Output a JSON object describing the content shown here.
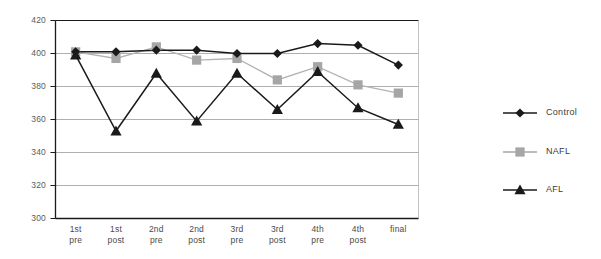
{
  "chart_data": {
    "type": "line",
    "title": "",
    "subtitle": "",
    "xlabel": "",
    "ylabel": "",
    "categories": [
      "1st pre",
      "1st post",
      "2nd pre",
      "2nd post",
      "3rd pre",
      "3rd post",
      "4th pre",
      "4th post",
      "final"
    ],
    "category_lines": [
      [
        "1st",
        "pre"
      ],
      [
        "1st",
        "post"
      ],
      [
        "2nd",
        "pre"
      ],
      [
        "2nd",
        "post"
      ],
      [
        "3rd",
        "pre"
      ],
      [
        "3rd",
        "post"
      ],
      [
        "4th",
        "pre"
      ],
      [
        "4th",
        "post"
      ],
      [
        "final",
        ""
      ]
    ],
    "series": [
      {
        "name": "Control",
        "marker": "diamond",
        "color": "#1a1a1a",
        "line_color": "#1a1a1a",
        "values": [
          401,
          401,
          402,
          402,
          400,
          400,
          406,
          405,
          393
        ]
      },
      {
        "name": "NAFL",
        "marker": "square",
        "color": "#a6a6a6",
        "line_color": "#b3b3b3",
        "values": [
          401,
          397,
          404,
          396,
          397,
          384,
          392,
          381,
          376
        ]
      },
      {
        "name": "AFL",
        "marker": "triangle",
        "color": "#1a1a1a",
        "line_color": "#1a1a1a",
        "values": [
          399,
          353,
          388,
          359,
          388,
          366,
          389,
          367,
          357
        ]
      }
    ],
    "ylim": [
      300,
      420
    ],
    "yticks": [
      300,
      320,
      340,
      360,
      380,
      400,
      420
    ],
    "ytick_labels": [
      "300",
      "320",
      "340",
      "360",
      "380",
      "400",
      "420"
    ],
    "grid": true,
    "grid_color": "#9a9a9a",
    "axis_color": "#1a1a1a",
    "legend_position": "right",
    "legend": [
      {
        "label": "Control",
        "marker": "diamond",
        "color": "#1a1a1a"
      },
      {
        "label": "NAFL",
        "marker": "square",
        "color": "#a6a6a6"
      },
      {
        "label": "AFL",
        "marker": "triangle",
        "color": "#1a1a1a"
      }
    ]
  }
}
